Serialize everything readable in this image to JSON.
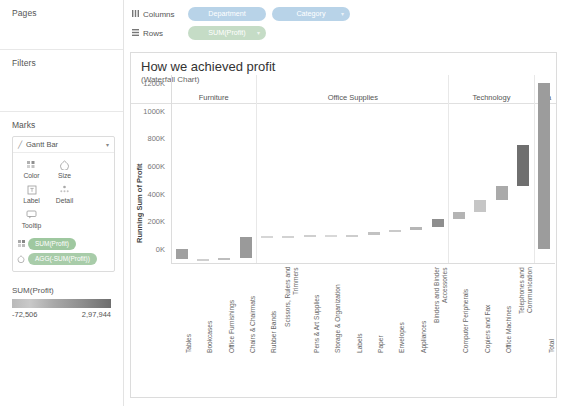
{
  "left_panel": {
    "pages_label": "Pages",
    "filters_label": "Filters",
    "marks_label": "Marks",
    "mark_type": "Gantt Bar",
    "mark_type_icon": "gantt-bar-icon",
    "mark_buttons": [
      {
        "label": "Color",
        "icon": "color-icon"
      },
      {
        "label": "Size",
        "icon": "size-icon"
      },
      {
        "label": "Label",
        "icon": "label-icon"
      },
      {
        "label": "Detail",
        "icon": "detail-icon"
      },
      {
        "label": "Tooltip",
        "icon": "tooltip-icon"
      }
    ],
    "mark_pills": [
      {
        "label": "SUM(Profit)",
        "icon": "color-marks-icon"
      },
      {
        "label": "AGG(-SUM(Profit))",
        "icon": "size-marks-icon"
      }
    ],
    "legend": {
      "title": "SUM(Profit)",
      "min": "-72,506",
      "max": "2,97,944",
      "min_color": "#c9c9c9",
      "max_color": "#6e6e6e"
    }
  },
  "shelves": {
    "columns_label": "Columns",
    "columns_icon": "columns-icon",
    "rows_label": "Rows",
    "rows_icon": "rows-icon",
    "columns_pills": [
      "Department",
      "Category"
    ],
    "rows_pills": [
      "SUM(Profit)"
    ],
    "column_pill_color": "#b8d3e8",
    "row_pill_color": "#c5dcc6"
  },
  "viz": {
    "title": "How we achieved profit",
    "subtitle": "(Waterfall Chart)"
  },
  "chart_data": {
    "type": "bar",
    "title": "How we achieved profit",
    "subtitle": "(Waterfall Chart)",
    "ylabel": "Running Sum of Profit",
    "xlabel": "",
    "ylim": [
      -60000,
      1280000
    ],
    "yticks": [
      "0K",
      "200K",
      "400K",
      "600K",
      "800K",
      "1000K",
      "1200K"
    ],
    "ytick_values": [
      0,
      200000,
      400000,
      600000,
      800000,
      1000000,
      1200000
    ],
    "grid": false,
    "legend_position": "left-panel",
    "groups": [
      {
        "name": "Furniture",
        "span": [
          0,
          4
        ]
      },
      {
        "name": "Office Supplies",
        "span": [
          4,
          13
        ]
      },
      {
        "name": "Technology",
        "span": [
          13,
          17
        ]
      },
      {
        "name": "Gra",
        "full_name": "Grand Total",
        "span": [
          17,
          18
        ]
      }
    ],
    "categories": [
      "Tables",
      "Bookcases",
      "Office Furnishings",
      "Chairs & Chairmats",
      "Rubber Bands",
      "Scissors, Rulers and Trimmers",
      "Pens & Art Supplies",
      "Storage & Organization",
      "Labels",
      "Paper",
      "Envelopes",
      "Appliances",
      "Binders and Binder Accessories",
      "Computer Peripherals",
      "Copiers and Fax",
      "Office Machines",
      "Telephones and Communication",
      "Total"
    ],
    "values": [
      -72506,
      -9000,
      20000,
      148000,
      1200,
      4000,
      6500,
      -8500,
      7000,
      22000,
      10500,
      25000,
      55000,
      53000,
      90000,
      95000,
      298000,
      1202000
    ],
    "running_start": [
      0,
      -72506,
      -81506,
      -61506,
      91494,
      92694,
      96694,
      103194,
      94694,
      101694,
      123694,
      134194,
      159194,
      214194,
      267194,
      357194,
      452194,
      0
    ],
    "running_end": [
      -72506,
      -81506,
      -61506,
      86494,
      92694,
      96694,
      103194,
      94694,
      101694,
      123694,
      134194,
      159194,
      214194,
      267194,
      357194,
      452194,
      750194,
      1202000
    ],
    "bar_colors": [
      "#a0a0a0",
      "#cfcfcf",
      "#bdbdbd",
      "#9a9a9a",
      "#d6d6d6",
      "#d2d2d2",
      "#cfcfcf",
      "#d8d8d8",
      "#cdcdcd",
      "#c2c2c2",
      "#cacaca",
      "#b6b6b6",
      "#8e8e8e",
      "#b4b4b4",
      "#c6c6c6",
      "#aaaaaa",
      "#6f6f6f",
      "#9c9c9c"
    ]
  }
}
